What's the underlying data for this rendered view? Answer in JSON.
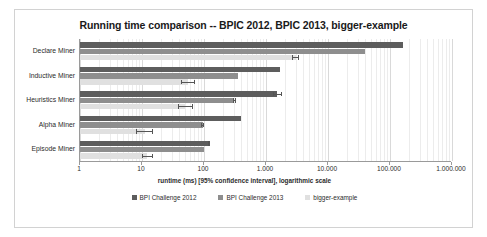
{
  "chart_data": {
    "type": "bar",
    "orientation": "horizontal",
    "title": "Running time comparison -- BPIC 2012, BPIC 2013, bigger-example",
    "xlabel": "runtime (ms) [95% confidence interval], logarithmic scale",
    "ylabel": "",
    "xscale": "log",
    "xlim": [
      1,
      1000000
    ],
    "xticks": [
      1,
      10,
      100,
      1000,
      10000,
      100000,
      1000000
    ],
    "xtick_labels": [
      "1",
      "10",
      "100",
      "1.000",
      "10.000",
      "100.000",
      "1.000.000"
    ],
    "grid": true,
    "legend_position": "bottom",
    "categories": [
      "Declare Miner",
      "Inductive Miner",
      "Heuristics Miner",
      "Alpha Miner",
      "Episode Miner"
    ],
    "series": [
      {
        "name": "BPI Challenge 2012",
        "color": "#5d5d5d",
        "values": [
          160000,
          1700,
          1500,
          400,
          120
        ],
        "errors_low": [
          160000,
          1700,
          1300,
          400,
          115
        ],
        "errors_high": [
          160000,
          1700,
          1800,
          400,
          125
        ]
      },
      {
        "name": "BPI Challenge 2013",
        "color": "#8e8e8e",
        "values": [
          40000,
          350,
          310,
          95,
          100
        ],
        "errors_low": [
          40000,
          350,
          290,
          90,
          100
        ],
        "errors_high": [
          40000,
          350,
          330,
          100,
          100
        ]
      },
      {
        "name": "bigger-example",
        "color": "#e0e0e0",
        "values": [
          3000,
          55,
          50,
          11,
          12
        ],
        "errors_low": [
          2600,
          42,
          38,
          8,
          10
        ],
        "errors_high": [
          3400,
          72,
          66,
          15,
          15
        ]
      }
    ]
  },
  "legend": {
    "items": [
      {
        "label": "BPI Challenge 2012"
      },
      {
        "label": "BPI Challenge 2013"
      },
      {
        "label": "bigger-example"
      }
    ]
  }
}
